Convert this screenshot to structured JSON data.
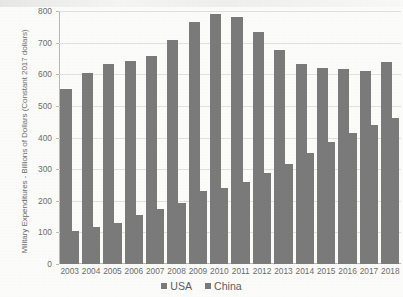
{
  "chart_data": {
    "type": "bar",
    "title": "",
    "xlabel": "",
    "ylabel": "Military Expenditures - Billions of Dollars (Constant 2017 dollars)",
    "ylim": [
      0,
      800
    ],
    "y_ticks": [
      0,
      100,
      200,
      300,
      400,
      500,
      600,
      700,
      800
    ],
    "grid": true,
    "legend_position": "bottom",
    "categories": [
      "2003",
      "2004",
      "2005",
      "2006",
      "2007",
      "2008",
      "2009",
      "2010",
      "2011",
      "2012",
      "2013",
      "2014",
      "2015",
      "2016",
      "2017",
      "2018"
    ],
    "series": [
      {
        "name": "USA",
        "color": "#7b7b7b",
        "values": [
          553,
          603,
          632,
          642,
          659,
          709,
          766,
          790,
          781,
          735,
          677,
          634,
          621,
          616,
          611,
          639
        ]
      },
      {
        "name": "China",
        "color": "#7b7b7b",
        "values": [
          105,
          118,
          131,
          154,
          173,
          192,
          230,
          240,
          259,
          287,
          317,
          352,
          385,
          415,
          438,
          462
        ]
      }
    ]
  },
  "axes": {
    "y_tick_labels": [
      "800",
      "700",
      "600",
      "500",
      "400",
      "300",
      "200",
      "100",
      "0"
    ],
    "y_axis_title": "Military Expenditures - Billions of Dollars (Constant 2017 dollars)"
  },
  "legend": {
    "items": [
      {
        "label": "USA",
        "color": "#7b7b7b"
      },
      {
        "label": "China",
        "color": "#7b7b7b"
      }
    ]
  },
  "style": {
    "bar_color": "#7b7b7b",
    "axis_color": "#b9b9b9",
    "grid_color": "#e2e2e2",
    "text_color": "#6e6e6e",
    "background": "#fdfdfc"
  }
}
